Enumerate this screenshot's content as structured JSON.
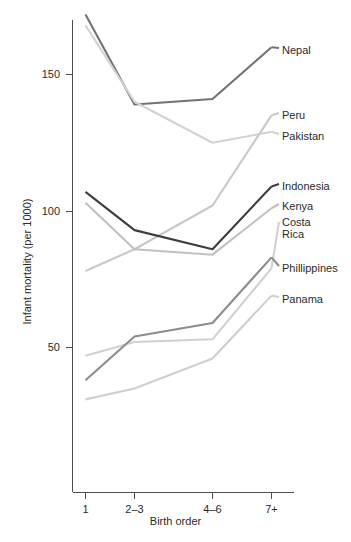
{
  "chart_data": {
    "type": "line",
    "title": "",
    "xlabel": "Birth order",
    "ylabel": "Infant mortality (per 1000)",
    "categories": [
      "1",
      "2–3",
      "4–6",
      "7+"
    ],
    "x_tick_labels": [
      "1",
      "2–3",
      "4–6",
      "7+"
    ],
    "y_tick_labels": [
      "50",
      "100",
      "150"
    ],
    "y_ticks": [
      50,
      100,
      150
    ],
    "ylim": [
      20,
      180
    ],
    "grid": false,
    "legend_position": "right-direct-labels",
    "series": [
      {
        "name": "Nepal",
        "label": "Nepal",
        "values": [
          172,
          139,
          141,
          160
        ],
        "color": "#737373"
      },
      {
        "name": "Peru",
        "label": "Peru",
        "values": [
          78,
          86,
          102,
          135
        ],
        "color": "#c8c8c8"
      },
      {
        "name": "Pakistan",
        "label": "Pakistan",
        "values": [
          168,
          140,
          125,
          129
        ],
        "color": "#d2d2d2"
      },
      {
        "name": "Indonesia",
        "label": "Indonesia",
        "values": [
          107,
          93,
          86,
          109
        ],
        "color": "#3d3d3d"
      },
      {
        "name": "Kenya",
        "label": "Kenya",
        "values": [
          103,
          86,
          84,
          101
        ],
        "color": "#c0c0c0"
      },
      {
        "name": "Costa Rica",
        "label": "Costa\nRica",
        "values": [
          47,
          52,
          53,
          79
        ],
        "color": "#d0d0d0"
      },
      {
        "name": "Phillippines",
        "label": "Phillippines",
        "values": [
          38,
          54,
          59,
          83
        ],
        "color": "#8c8c8c"
      },
      {
        "name": "Panama",
        "label": "Panama",
        "values": [
          31,
          35,
          46,
          69
        ],
        "color": "#cfcfcf"
      }
    ]
  },
  "axes": {
    "x_title": "Birth order",
    "y_title": "Infant mortality (per 1000)",
    "y_tick_0": "50",
    "y_tick_1": "100",
    "y_tick_2": "150",
    "x_tick_0": "1",
    "x_tick_1": "2–3",
    "x_tick_2": "4–6",
    "x_tick_3": "7+"
  },
  "labels": {
    "nepal": "Nepal",
    "peru": "Peru",
    "pakistan": "Pakistan",
    "indonesia": "Indonesia",
    "kenya": "Kenya",
    "costa_rica_l1": "Costa",
    "costa_rica_l2": "Rica",
    "phillippines": "Phillippines",
    "panama": "Panama"
  }
}
